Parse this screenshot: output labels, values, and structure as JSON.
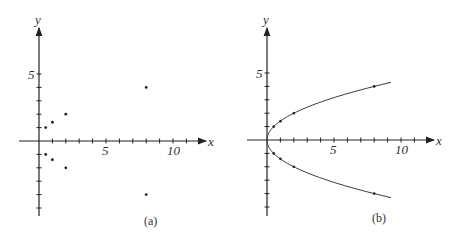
{
  "panels": [
    {
      "id": "a",
      "caption": "(a)",
      "x_axis_label": "x",
      "y_axis_label": "y",
      "x_tick_labels": [
        "5",
        "10"
      ],
      "y_tick_labels": [
        "5"
      ],
      "points": [
        [
          0.5,
          1
        ],
        [
          1,
          1.4
        ],
        [
          2,
          2
        ],
        [
          8,
          4
        ],
        [
          0.5,
          -1
        ],
        [
          1,
          -1.4
        ],
        [
          2,
          -2
        ],
        [
          8,
          -4
        ]
      ]
    },
    {
      "id": "b",
      "caption": "(b)",
      "x_axis_label": "x",
      "y_axis_label": "y",
      "x_tick_labels": [
        "5",
        "10"
      ],
      "y_tick_labels": [
        "5"
      ],
      "curve": "x = y^2 / 2",
      "points": [
        [
          0.5,
          1
        ],
        [
          1,
          1.4
        ],
        [
          2,
          2
        ],
        [
          8,
          4
        ],
        [
          0.5,
          -1
        ],
        [
          1,
          -1.4
        ],
        [
          2,
          -2
        ],
        [
          8,
          -4
        ]
      ]
    }
  ],
  "chart_data": [
    {
      "type": "scatter",
      "title": "(a)",
      "xlabel": "x",
      "ylabel": "y",
      "xlim": [
        -1.5,
        12
      ],
      "ylim": [
        -5.5,
        8
      ],
      "x_ticks": [
        5,
        10
      ],
      "y_ticks": [
        5
      ],
      "series": [
        {
          "name": "points",
          "x": [
            0.5,
            1,
            2,
            8,
            0.5,
            1,
            2,
            8
          ],
          "y": [
            1,
            1.4,
            2,
            4,
            -1,
            -1.4,
            -2,
            -4
          ]
        }
      ]
    },
    {
      "type": "line",
      "title": "(b)",
      "xlabel": "x",
      "ylabel": "y",
      "xlim": [
        -1.5,
        12
      ],
      "ylim": [
        -5.5,
        8
      ],
      "x_ticks": [
        5,
        10
      ],
      "y_ticks": [
        5
      ],
      "series": [
        {
          "name": "parabola x=y^2/2",
          "x": [
            9,
            8,
            4.5,
            2,
            1,
            0.5,
            0,
            0.5,
            1,
            2,
            4.5,
            8,
            9
          ],
          "y": [
            4.24,
            4,
            3,
            2,
            1.41,
            1,
            0,
            -1,
            -1.41,
            -2,
            -3,
            -4,
            -4.24
          ]
        },
        {
          "name": "marked points",
          "x": [
            0.5,
            1,
            2,
            8,
            0.5,
            1,
            2,
            8
          ],
          "y": [
            1,
            1.41,
            2,
            4,
            -1,
            -1.41,
            -2,
            -4
          ]
        }
      ]
    }
  ]
}
